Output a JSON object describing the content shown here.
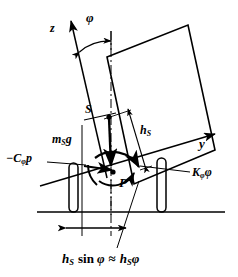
{
  "figure": {
    "type": "engineering-diagram",
    "background_color": "#ffffff",
    "stroke_color": "#000000",
    "width": 238,
    "height": 277
  },
  "labels": {
    "z_axis": "z",
    "y_axis": "y",
    "roll_angle": "φ",
    "cg_point": "S",
    "roll_center_point": "P",
    "weight_force": "m",
    "weight_force_sub": "S",
    "weight_force_tail": "g",
    "cg_height": "h",
    "cg_height_sub": "S",
    "damping_moment_lead": "−C",
    "damping_moment_sub": "φ",
    "damping_moment_tail": "p",
    "stiffness_moment_lead": "K",
    "stiffness_moment_sub": "φ",
    "stiffness_moment_tail": "φ",
    "lateral_offset_h": "h",
    "lateral_offset_h_sub": "S",
    "lateral_offset_sin": "sin",
    "lateral_offset_phi": "φ",
    "lateral_offset_approx": "≈",
    "lateral_offset_rhs_h": "h",
    "lateral_offset_rhs_sub": "S",
    "lateral_offset_rhs_phi": "φ"
  },
  "geometry": {
    "roll_angle_degrees": 15,
    "body_outline": "107,57 188,25 215,150 134,184",
    "ground_line_y": 212,
    "ground_line_x1": 37,
    "ground_line_x2": 225,
    "centerline_x": 111,
    "cg_x": 109,
    "cg_y": 117,
    "roll_center_x": 113,
    "roll_center_y": 172,
    "wheel_left": {
      "x": 69,
      "y": 163,
      "w": 9,
      "h": 49
    },
    "wheel_right": {
      "x": 157,
      "y": 158,
      "w": 9,
      "h": 54
    },
    "dimension_y": 228,
    "dimension_x1": 82,
    "dimension_x2": 128
  }
}
